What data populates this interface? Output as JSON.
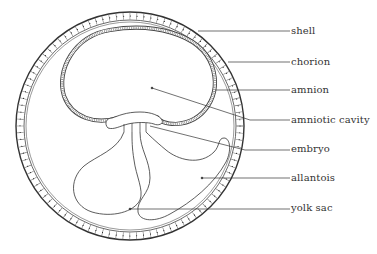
{
  "diagram": {
    "type": "labeled anatomical diagram",
    "colors": {
      "line": "#333333",
      "background": "#ffffff"
    },
    "labels": [
      {
        "id": "shell",
        "text": "shell",
        "y": 31
      },
      {
        "id": "chorion",
        "text": "chorion",
        "y": 62
      },
      {
        "id": "amnion",
        "text": "amnion",
        "y": 90
      },
      {
        "id": "amniotic-cavity",
        "text": "amniotic cavity",
        "y": 120
      },
      {
        "id": "embryo",
        "text": "embryo",
        "y": 148
      },
      {
        "id": "allantois",
        "text": "allantois",
        "y": 178
      },
      {
        "id": "yolk-sac",
        "text": "yolk sac",
        "y": 207
      }
    ]
  }
}
